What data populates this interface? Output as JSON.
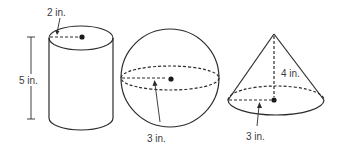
{
  "figure": {
    "shapes": [
      {
        "type": "cylinder",
        "labels": {
          "radius": "2 in.",
          "height": "5 in."
        }
      },
      {
        "type": "sphere",
        "labels": {
          "radius": "3 in."
        }
      },
      {
        "type": "cone",
        "labels": {
          "height": "4 in.",
          "radius": "3 in."
        }
      }
    ]
  },
  "colors": {
    "line": "#2b2b2b",
    "text": "#3a3a3a",
    "background": "#ffffff"
  }
}
